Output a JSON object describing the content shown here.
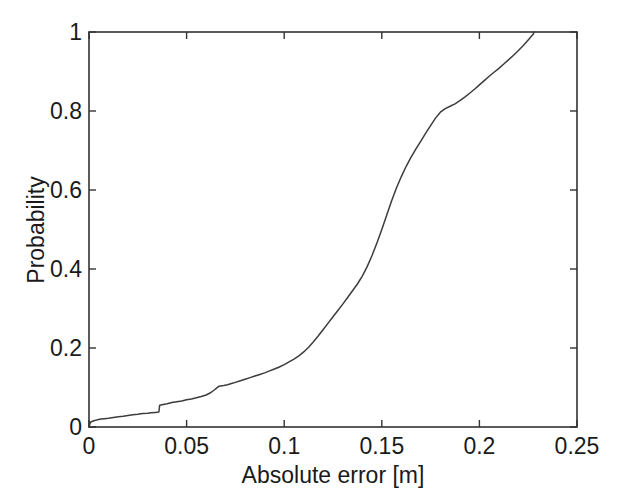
{
  "figure": {
    "background_color": "#ffffff",
    "line_color": "#3c3c3c",
    "axis_color": "#333333"
  },
  "axis_titles": {
    "x": "Absolute error [m]",
    "y": "Probability"
  },
  "ticks": {
    "x_labels": [
      "0",
      "0.05",
      "0.1",
      "0.15",
      "0.2",
      "0.25"
    ],
    "y_labels": [
      "0",
      "0.2",
      "0.4",
      "0.6",
      "0.8",
      "1"
    ]
  },
  "chart_data": {
    "type": "line",
    "title": "",
    "xlabel": "Absolute error [m]",
    "ylabel": "Probability",
    "xlim": [
      0,
      0.25
    ],
    "ylim": [
      0,
      1
    ],
    "xticks": [
      0,
      0.05,
      0.1,
      0.15,
      0.2,
      0.25
    ],
    "yticks": [
      0,
      0.2,
      0.4,
      0.6,
      0.8,
      1
    ],
    "grid": false,
    "legend": null,
    "series": [
      {
        "name": "Empirical CDF of absolute error",
        "x": [
          0.0,
          0.0005,
          0.0008,
          0.0015,
          0.0025,
          0.004,
          0.006,
          0.008,
          0.01,
          0.0125,
          0.015,
          0.0175,
          0.02,
          0.0225,
          0.025,
          0.0275,
          0.03,
          0.032,
          0.034,
          0.0358,
          0.0362,
          0.038,
          0.04,
          0.0425,
          0.045,
          0.0475,
          0.05,
          0.0525,
          0.055,
          0.0575,
          0.06,
          0.062,
          0.064,
          0.0655,
          0.0665,
          0.0675,
          0.069,
          0.071,
          0.073,
          0.075,
          0.0775,
          0.08,
          0.0825,
          0.085,
          0.0875,
          0.09,
          0.0925,
          0.095,
          0.0975,
          0.1,
          0.1025,
          0.105,
          0.1075,
          0.11,
          0.1125,
          0.115,
          0.1175,
          0.12,
          0.1225,
          0.125,
          0.1275,
          0.13,
          0.1325,
          0.135,
          0.1375,
          0.14,
          0.1425,
          0.145,
          0.1475,
          0.15,
          0.1525,
          0.155,
          0.1575,
          0.16,
          0.1625,
          0.165,
          0.1675,
          0.17,
          0.1725,
          0.175,
          0.1775,
          0.18,
          0.1825,
          0.185,
          0.1875,
          0.19,
          0.1925,
          0.195,
          0.1975,
          0.2,
          0.2025,
          0.205,
          0.2075,
          0.21,
          0.2125,
          0.215,
          0.2175,
          0.22,
          0.2225,
          0.225,
          0.2275,
          0.228
        ],
        "y": [
          0.0,
          0.008,
          0.012,
          0.014,
          0.016,
          0.018,
          0.02,
          0.021,
          0.022,
          0.024,
          0.026,
          0.027,
          0.029,
          0.031,
          0.032,
          0.034,
          0.035,
          0.036,
          0.037,
          0.038,
          0.055,
          0.057,
          0.059,
          0.062,
          0.064,
          0.066,
          0.069,
          0.071,
          0.074,
          0.077,
          0.081,
          0.086,
          0.093,
          0.099,
          0.103,
          0.104,
          0.105,
          0.107,
          0.11,
          0.113,
          0.117,
          0.121,
          0.125,
          0.129,
          0.133,
          0.137,
          0.142,
          0.147,
          0.152,
          0.158,
          0.165,
          0.172,
          0.18,
          0.19,
          0.202,
          0.216,
          0.231,
          0.247,
          0.263,
          0.279,
          0.295,
          0.311,
          0.328,
          0.345,
          0.362,
          0.382,
          0.406,
          0.434,
          0.466,
          0.5,
          0.536,
          0.572,
          0.605,
          0.634,
          0.66,
          0.683,
          0.704,
          0.724,
          0.744,
          0.763,
          0.782,
          0.797,
          0.806,
          0.812,
          0.818,
          0.826,
          0.835,
          0.845,
          0.855,
          0.866,
          0.877,
          0.888,
          0.898,
          0.908,
          0.919,
          0.93,
          0.941,
          0.953,
          0.966,
          0.98,
          0.994,
          1.0
        ]
      }
    ]
  },
  "geometry": {
    "plot_left": 89,
    "plot_right": 577,
    "plot_top": 32,
    "plot_bottom": 427
  }
}
